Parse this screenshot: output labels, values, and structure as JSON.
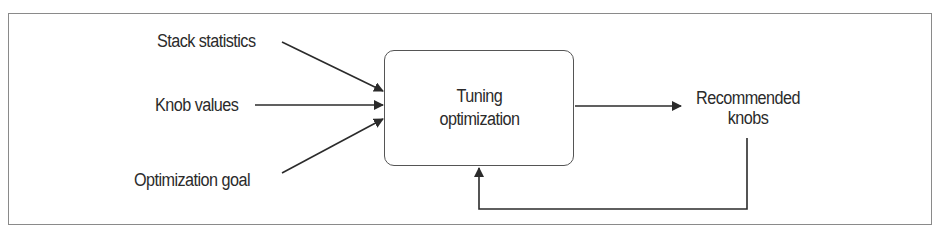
{
  "diagram": {
    "inputs": [
      {
        "label": "Stack statistics"
      },
      {
        "label": "Knob values"
      },
      {
        "label": "Optimization goal"
      }
    ],
    "process": {
      "line1": "Tuning",
      "line2": "optimization"
    },
    "output": {
      "line1": "Recommended",
      "line2": "knobs"
    },
    "feedback": {
      "from": "Recommended knobs",
      "to": "Tuning optimization"
    },
    "colors": {
      "line": "#2b2b2b",
      "frame": "#8a8a8a",
      "background": "#ffffff"
    }
  }
}
